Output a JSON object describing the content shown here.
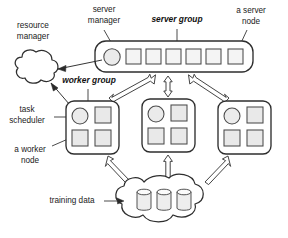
{
  "figure": {
    "background_color": "#ffffff",
    "stroke_color": "#2e2e2e",
    "node_fill_color": "#e9e9e9"
  },
  "labels": {
    "resource_manager_line1": "resource",
    "resource_manager_line2": "manager",
    "server_manager_line1": "server",
    "server_manager_line2": "manager",
    "server_group": "server group",
    "a_server_node_line1": "a server",
    "a_server_node_line2": "node",
    "worker_group": "worker group",
    "task_scheduler_line1": "task",
    "task_scheduler_line2": "scheduler",
    "a_worker_node_line1": "a worker",
    "a_worker_node_line2": "node",
    "training_data": "training data"
  },
  "components": {
    "resource_manager": {
      "name": "resource manager",
      "shape": "cloud"
    },
    "server_group": {
      "name": "server group",
      "shape": "rounded-rectangle",
      "manager": {
        "name": "server manager",
        "shape": "circle"
      },
      "server_nodes_count": 6,
      "server_node_shape": "square"
    },
    "worker_groups": [
      {
        "name": "worker group 1",
        "scheduler": "task scheduler",
        "worker_nodes_count": 3
      },
      {
        "name": "worker group 2",
        "scheduler": "task scheduler",
        "worker_nodes_count": 3
      },
      {
        "name": "worker group 3",
        "scheduler": "task scheduler",
        "worker_nodes_count": 3
      }
    ],
    "training_data": {
      "name": "training data",
      "shape": "cloud",
      "database_count": 3,
      "database_shape": "cylinder"
    }
  },
  "connections": [
    {
      "from": "server manager",
      "to": "resource manager",
      "style": "thin-arrow",
      "direction": "one-way"
    },
    {
      "from": "task scheduler",
      "to": "resource manager",
      "style": "thin-arrow",
      "direction": "one-way"
    },
    {
      "from": "worker group 1",
      "to": "server group",
      "style": "block-arrow",
      "direction": "two-way"
    },
    {
      "from": "worker group 2",
      "to": "server group",
      "style": "block-arrow",
      "direction": "two-way"
    },
    {
      "from": "worker group 3",
      "to": "server group",
      "style": "block-arrow",
      "direction": "two-way"
    },
    {
      "from": "training data",
      "to": "worker group 1",
      "style": "block-arrow",
      "direction": "one-way"
    },
    {
      "from": "training data",
      "to": "worker group 2",
      "style": "block-arrow",
      "direction": "one-way"
    },
    {
      "from": "training data",
      "to": "worker group 3",
      "style": "block-arrow",
      "direction": "one-way"
    }
  ]
}
